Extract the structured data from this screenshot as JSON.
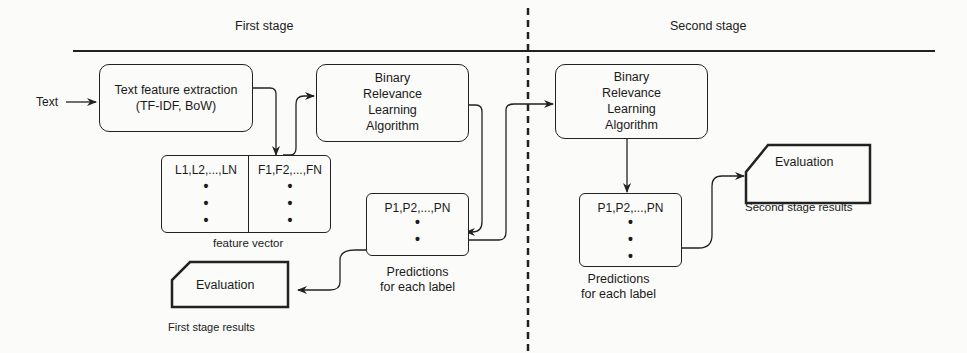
{
  "stages": {
    "first": "First stage",
    "second": "Second stage"
  },
  "input_label": "Text",
  "first_stage": {
    "extraction_box": {
      "line1": "Text feature extraction",
      "line2": "(TF-IDF, BoW)"
    },
    "br_algorithm": {
      "line1": "Binary",
      "line2": "Relevance",
      "line3": "Learning",
      "line4": "Algorithm"
    },
    "feature_vector": {
      "labels_col": "L1,L2,...,LN",
      "features_col": "F1,F2,...,FN",
      "caption": "feature vector"
    },
    "predictions": {
      "header": "P1,P2,...,PN",
      "caption_line1": "Predictions",
      "caption_line2": "for each label"
    },
    "evaluation": {
      "label": "Evaluation",
      "caption": "First stage results"
    }
  },
  "second_stage": {
    "br_algorithm": {
      "line1": "Binary",
      "line2": "Relevance",
      "line3": "Learning",
      "line4": "Algorithm"
    },
    "predictions": {
      "header": "P1,P2,...,PN",
      "caption_line1": "Predictions",
      "caption_line2": "for each label"
    },
    "evaluation": {
      "label": "Evaluation",
      "caption": "Second stage results"
    }
  },
  "dots": "•",
  "colors": {
    "line": "#222222",
    "background": "#fbfbf9"
  }
}
